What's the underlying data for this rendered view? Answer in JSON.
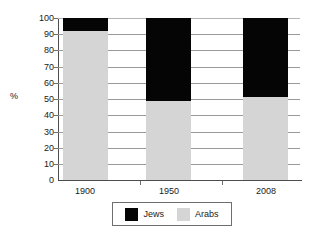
{
  "chart_data": {
    "type": "bar",
    "subtype": "stacked-100-percent",
    "title": "",
    "xlabel": "",
    "ylabel": "%",
    "categories": [
      "1900",
      "1950",
      "2008"
    ],
    "ylim": [
      0,
      100
    ],
    "ytick_labels": [
      "0",
      "10",
      "20",
      "30",
      "40",
      "50",
      "60",
      "70",
      "80",
      "90",
      "100"
    ],
    "ytick_values": [
      0,
      10,
      20,
      30,
      40,
      50,
      60,
      70,
      80,
      90,
      100
    ],
    "grid": true,
    "legend_position": "bottom",
    "series": [
      {
        "name": "Jews",
        "color": "#050505",
        "values": [
          8,
          51,
          49
        ]
      },
      {
        "name": "Arabs",
        "color": "#d5d5d5",
        "values": [
          92,
          49,
          51
        ]
      }
    ]
  },
  "legend": {
    "items": [
      {
        "label": "Jews",
        "swatch": "black-swatch-icon"
      },
      {
        "label": "Arabs",
        "swatch": "gray-swatch-icon"
      }
    ]
  },
  "axis": {
    "y_label": "%",
    "y_ticks": [
      "100",
      "90",
      "80",
      "70",
      "60",
      "50",
      "40",
      "30",
      "20",
      "10",
      "0"
    ],
    "x_ticks": [
      "1900",
      "1950",
      "2008"
    ]
  },
  "colors": {
    "jews": "#050505",
    "arabs": "#d5d5d5",
    "gridline": "#9a9a9a",
    "axis": "#4d4d4d",
    "text": "#1a1a1a",
    "background": "#ffffff"
  }
}
